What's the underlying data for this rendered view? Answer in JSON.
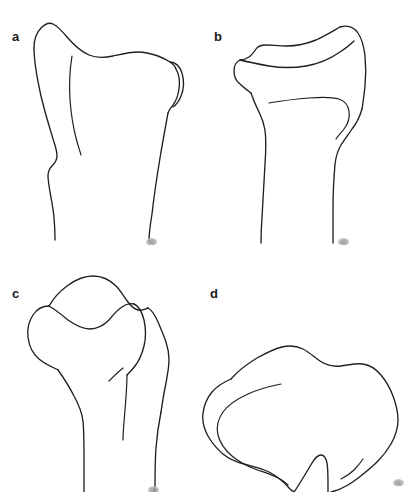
{
  "figure": {
    "type": "line-drawing-panel-figure",
    "background_color": "#ffffff",
    "stroke_color": "#231f20",
    "width": 415,
    "height": 492,
    "panel_count": 4,
    "panel_layout": "2x2 grid"
  },
  "panels": [
    {
      "id": "a",
      "label": "a",
      "label_position": "top-left",
      "view": "anterior proximal bone, long shaft below a broad flared head",
      "has_inner_line": true,
      "has_smudge": true
    },
    {
      "id": "b",
      "label": "b",
      "label_position": "top-left",
      "view": "oblique proximal bone with ridged articular margin and hooked inner line",
      "has_inner_line": true,
      "has_smudge": true
    },
    {
      "id": "c",
      "label": "c",
      "label_position": "top-left",
      "view": "lateral proximal bone with rounded condylar lobe and saddle notch",
      "has_inner_line": true,
      "has_smudge": true
    },
    {
      "id": "d",
      "label": "d",
      "label_position": "top-left",
      "view": "superior axial view, lobate outline with posterior notch and inner rim",
      "has_inner_line": true,
      "has_smudge": true
    }
  ],
  "labels": {
    "a": "a",
    "b": "b",
    "c": "c",
    "d": "d"
  }
}
